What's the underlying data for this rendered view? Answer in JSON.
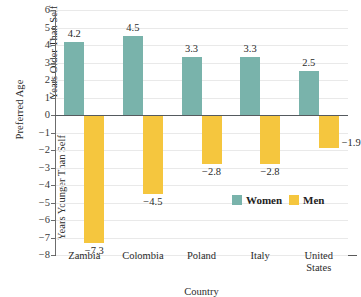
{
  "chart_data": {
    "type": "bar",
    "title": "",
    "xlabel": "Country",
    "ylabel": "Preferred Age",
    "ylabel_upper": "Years Older Than Self",
    "ylabel_lower": "Years Younger Than Self",
    "categories": [
      "Zambia",
      "Colombia",
      "Poland",
      "Italy",
      "United\nStates"
    ],
    "series": [
      {
        "name": "Women",
        "color": "#79b3ab",
        "values": [
          4.2,
          4.5,
          3.3,
          3.3,
          2.5
        ],
        "labels": [
          "4.2",
          "4.5",
          "3.3",
          "3.3",
          "2.5"
        ]
      },
      {
        "name": "Men",
        "color": "#f5c63e",
        "values": [
          -7.3,
          -4.5,
          -2.8,
          -2.8,
          -1.9
        ],
        "labels": [
          "−7.3",
          "−4.5",
          "−2.8",
          "−2.8",
          "−1.9"
        ]
      }
    ],
    "ylim": [
      -8,
      6
    ],
    "yticks": [
      6,
      5,
      4,
      3,
      2,
      1,
      0,
      -1,
      -2,
      -3,
      -4,
      -5,
      -6,
      -7,
      -8
    ],
    "ytick_labels": [
      "6",
      "5",
      "4",
      "3",
      "2",
      "1",
      "0",
      "−1",
      "−2",
      "−3",
      "−4",
      "−5",
      "−6",
      "−7",
      "−8"
    ],
    "grid": true,
    "legend_position": "inside-lower-right"
  },
  "legend": {
    "items": [
      {
        "label": "Women",
        "color": "#79b3ab"
      },
      {
        "label": "Men",
        "color": "#f5c63e"
      }
    ]
  }
}
